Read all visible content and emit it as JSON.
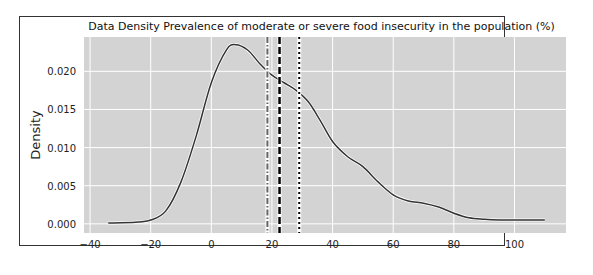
{
  "chart_data": {
    "type": "line",
    "title": "Data Density Prevalence of moderate or severe food insecurity in the population (%)",
    "xlabel": "",
    "ylabel": "Density",
    "xlim": [
      -42,
      117
    ],
    "ylim": [
      -0.0012,
      0.0245
    ],
    "grid": true,
    "background": "#d3d3d3",
    "x_ticks": [
      -40,
      -20,
      0,
      20,
      40,
      60,
      80,
      100
    ],
    "x_tick_labels": [
      "−40",
      "−20",
      "0",
      "20",
      "40",
      "60",
      "80",
      "100"
    ],
    "y_ticks": [
      0.0,
      0.005,
      0.01,
      0.015,
      0.02
    ],
    "y_tick_labels": [
      "0.000",
      "0.005",
      "0.010",
      "0.015",
      "0.020"
    ],
    "series": [
      {
        "name": "density",
        "color": "#333333",
        "x": [
          -34,
          -25,
          -20,
          -15,
          -10,
          -5,
          0,
          5,
          8,
          12,
          16,
          20,
          24,
          28,
          32,
          36,
          40,
          45,
          50,
          55,
          60,
          65,
          70,
          75,
          80,
          85,
          90,
          95,
          100,
          105,
          110
        ],
        "values": [
          0.0001,
          0.0002,
          0.0005,
          0.0017,
          0.0055,
          0.0115,
          0.0185,
          0.0228,
          0.0235,
          0.0228,
          0.021,
          0.0195,
          0.0185,
          0.0175,
          0.016,
          0.0135,
          0.0108,
          0.0088,
          0.0075,
          0.0055,
          0.0038,
          0.003,
          0.0027,
          0.0022,
          0.0014,
          0.0008,
          0.0006,
          0.0005,
          0.0005,
          0.0005,
          0.0005
        ]
      }
    ],
    "vlines": [
      {
        "name": "dashdot",
        "x": 18.5,
        "style": "dashdot",
        "color": "#666666"
      },
      {
        "name": "dashed",
        "x": 22.5,
        "style": "dashed",
        "color": "#000000"
      },
      {
        "name": "dotted",
        "x": 29,
        "style": "dotted",
        "color": "#000000"
      }
    ]
  }
}
